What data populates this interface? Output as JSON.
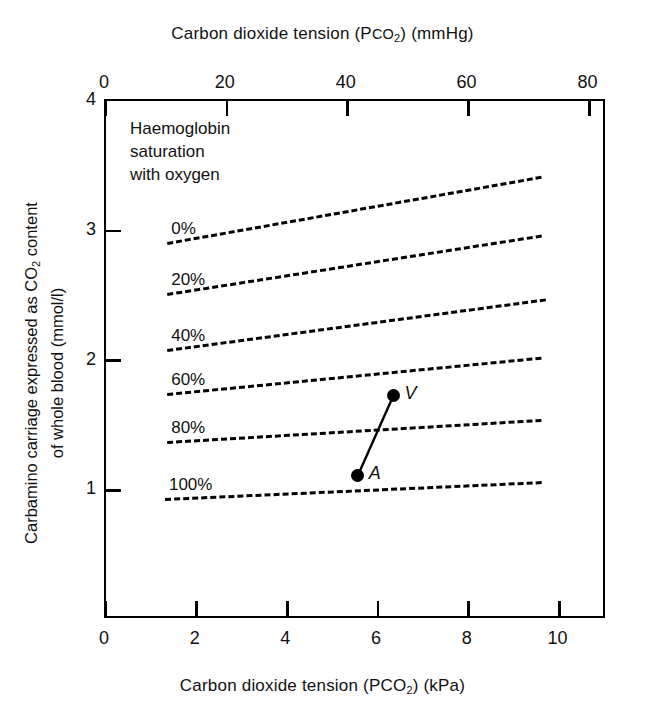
{
  "chart_data": {
    "type": "line",
    "title": "",
    "xlabel": "Carbon dioxide tension (PCO2) (kPa)",
    "xlabel_top": "Carbon dioxide tension (PCO2) (mmHg)",
    "ylabel": "Carbamino carriage expressed as CO2 content of whole blood (mmol/l)",
    "xlim": [
      0,
      11.05
    ],
    "ylim": [
      0,
      4
    ],
    "xlim_top_mmhg": [
      0,
      82.9
    ],
    "ylim_label": "mmol/l",
    "grid": false,
    "legend_position": "inline-left-of-each-line",
    "x_ticks_bottom": [
      0,
      2,
      4,
      6,
      8,
      10
    ],
    "x_ticks_top": [
      0,
      20,
      40,
      60,
      80
    ],
    "y_ticks": [
      1,
      2,
      3,
      4
    ],
    "annotation": "Haemoglobin saturation with oxygen",
    "series": [
      {
        "name": "0%",
        "x": [
          1.35,
          9.6
        ],
        "values": [
          2.91,
          3.42
        ]
      },
      {
        "name": "20%",
        "x": [
          1.35,
          9.6
        ],
        "values": [
          2.52,
          2.97
        ]
      },
      {
        "name": "40%",
        "x": [
          1.35,
          9.7
        ],
        "values": [
          2.09,
          2.48
        ]
      },
      {
        "name": "60%",
        "x": [
          1.35,
          9.6
        ],
        "values": [
          1.75,
          2.03
        ]
      },
      {
        "name": "80%",
        "x": [
          1.35,
          9.6
        ],
        "values": [
          1.38,
          1.55
        ]
      },
      {
        "name": "100%",
        "x": [
          1.3,
          9.6
        ],
        "values": [
          0.94,
          1.07
        ]
      }
    ],
    "points": [
      {
        "label": "A",
        "x": 5.55,
        "y": 1.11
      },
      {
        "label": "V",
        "x": 6.34,
        "y": 1.73
      }
    ],
    "point_connector": {
      "from": "A",
      "to": "V"
    }
  },
  "axes": {
    "top": {
      "title_prefix": "Carbon dioxide tension (P",
      "title_co": "CO",
      "title_sub": "2",
      "title_suffix": ")  (mmHg)",
      "ticks": [
        {
          "value": 0,
          "label": "0"
        },
        {
          "value": 20,
          "label": "20"
        },
        {
          "value": 40,
          "label": "40"
        },
        {
          "value": 60,
          "label": "60"
        },
        {
          "value": 80,
          "label": "80"
        }
      ]
    },
    "bottom": {
      "title_prefix": "Carbon dioxide tension (P",
      "title_co": "CO",
      "title_sub": "2",
      "title_suffix": ") (kPa)",
      "ticks": [
        {
          "value": 0,
          "label": "0"
        },
        {
          "value": 2,
          "label": "2"
        },
        {
          "value": 4,
          "label": "4"
        },
        {
          "value": 6,
          "label": "6"
        },
        {
          "value": 8,
          "label": "8"
        },
        {
          "value": 10,
          "label": "10"
        }
      ]
    },
    "left": {
      "title_line1": "Carbamino carriage expressed as CO",
      "title_sub": "2",
      "title_line1b": " content",
      "title_line2": "of whole blood (mmol/l)",
      "ticks": [
        {
          "value": 4,
          "label": "4"
        },
        {
          "value": 3,
          "label": "3"
        },
        {
          "value": 2,
          "label": "2"
        },
        {
          "value": 1,
          "label": "1"
        }
      ]
    }
  },
  "annotation_block": {
    "line1": "Haemoglobin",
    "line2": "saturation",
    "line3": "with oxygen"
  },
  "colors": {
    "axis": "#000000",
    "line": "#000000",
    "point": "#000000",
    "background": "#ffffff"
  }
}
